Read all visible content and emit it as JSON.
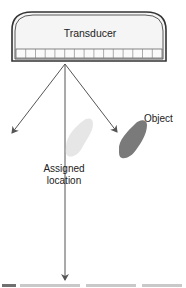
{
  "diagram": {
    "transducer": {
      "label": "Transducer",
      "element_count": 15
    },
    "object": {
      "label": "Object",
      "color": "#7a7a7a"
    },
    "artifact": {
      "label_line1": "Assigned",
      "label_line2": "location",
      "color": "#e4e4e4"
    },
    "beams": [
      {
        "name": "left-side-lobe"
      },
      {
        "name": "main-beam"
      },
      {
        "name": "right-side-lobe"
      }
    ],
    "colors": {
      "outline": "#333333",
      "transducer_fill": "#f4f4f4",
      "beam": "#555555"
    }
  },
  "caption": {
    "visible": "clipped"
  }
}
